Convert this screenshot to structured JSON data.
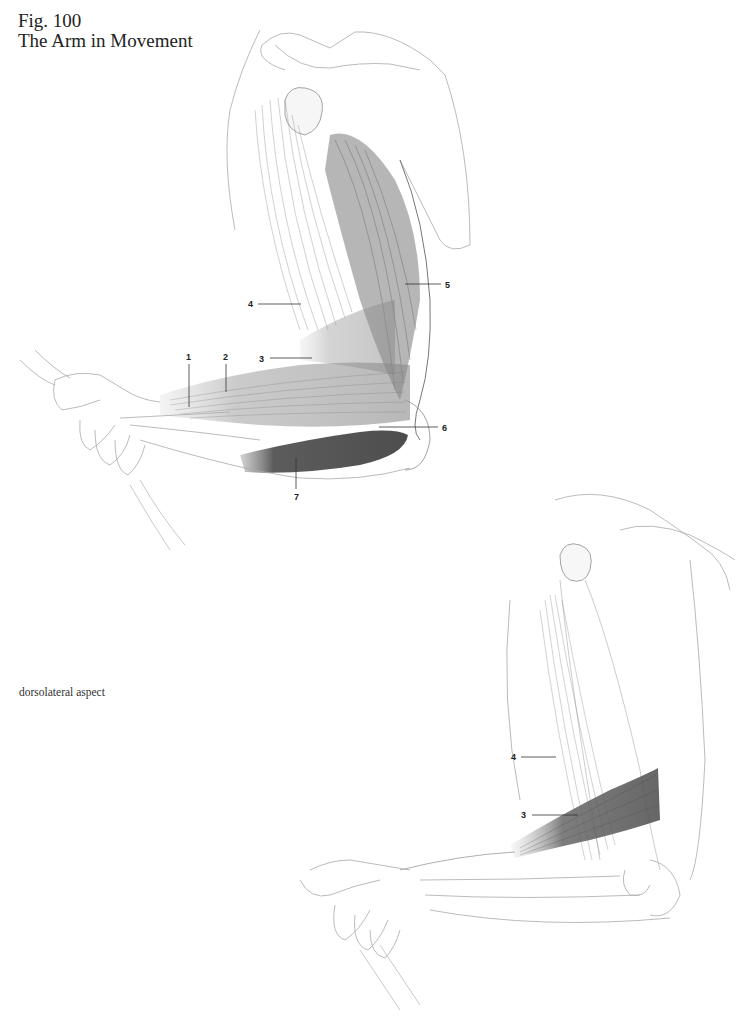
{
  "figure": {
    "number": "Fig. 100",
    "title": "The Arm in Movement"
  },
  "caption": "dorsolateral aspect",
  "illustrations": [
    {
      "id": "upper",
      "description": "Flexed arm, lateral view with shoulder, humerus and forearm muscles",
      "labels": [
        {
          "num": "1",
          "x": 186,
          "y": 352,
          "leader": [
            189,
            364,
            189,
            407
          ]
        },
        {
          "num": "2",
          "x": 223,
          "y": 352,
          "leader": [
            226,
            364,
            226,
            392
          ]
        },
        {
          "num": "3",
          "x": 259,
          "y": 354,
          "leader": [
            270,
            358,
            312,
            358
          ]
        },
        {
          "num": "4",
          "x": 248,
          "y": 299,
          "leader": [
            258,
            304,
            301,
            304
          ]
        },
        {
          "num": "5",
          "x": 445,
          "y": 280,
          "leader": [
            405,
            284,
            441,
            284
          ]
        },
        {
          "num": "6",
          "x": 442,
          "y": 423,
          "leader": [
            379,
            427,
            438,
            427
          ]
        },
        {
          "num": "7",
          "x": 294,
          "y": 492,
          "leader": [
            296,
            458,
            296,
            489
          ]
        }
      ]
    },
    {
      "id": "lower",
      "description": "Flexed arm, dorsolateral aspect with forearm muscle highlighted",
      "labels": [
        {
          "num": "4",
          "x": 511,
          "y": 752,
          "leader": [
            521,
            757,
            556,
            757
          ]
        },
        {
          "num": "3",
          "x": 521,
          "y": 810,
          "leader": [
            532,
            815,
            578,
            815
          ]
        }
      ]
    }
  ],
  "colors": {
    "ink": "#222222",
    "sketch": "#9a9a9a",
    "shade_dark": "#4a4a4a",
    "shade_mid": "#8c8c8c",
    "paper": "#ffffff"
  }
}
